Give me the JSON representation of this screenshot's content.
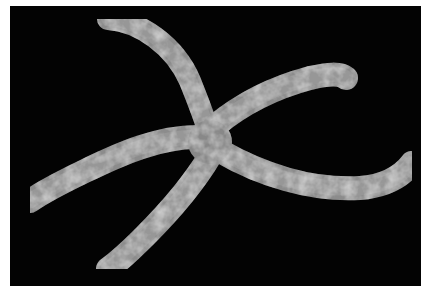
{
  "image": {
    "subject": "starfish",
    "description": "Grayscale photo of a five-armed mottled starfish on a black background",
    "background_color": "#030303",
    "border_color": "#ffffff",
    "starfish_colors": {
      "base": "#8a8a8a",
      "light": "#bdbdbd",
      "dark": "#6a6a6a"
    }
  }
}
